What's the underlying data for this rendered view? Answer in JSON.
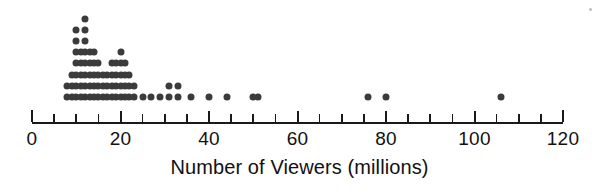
{
  "chart_data": {
    "type": "dotplot",
    "title": "",
    "xlabel": "Number of Viewers (millions)",
    "ylabel": "",
    "xlim": [
      0,
      120
    ],
    "grid": false,
    "legend": null,
    "tick_labels": [
      "0",
      "20",
      "40",
      "60",
      "80",
      "100",
      "120"
    ],
    "tick_values": [
      0,
      20,
      40,
      60,
      80,
      100,
      120
    ],
    "minor_tick_step": 5,
    "dot_color": "#3b3b3b",
    "axis_color": "#1a1a1a",
    "value_counts": [
      {
        "value": 8,
        "count": 2
      },
      {
        "value": 9,
        "count": 3
      },
      {
        "value": 10,
        "count": 7
      },
      {
        "value": 11,
        "count": 5
      },
      {
        "value": 12,
        "count": 8
      },
      {
        "value": 13,
        "count": 5
      },
      {
        "value": 14,
        "count": 5
      },
      {
        "value": 15,
        "count": 4
      },
      {
        "value": 16,
        "count": 3
      },
      {
        "value": 17,
        "count": 3
      },
      {
        "value": 18,
        "count": 4
      },
      {
        "value": 19,
        "count": 4
      },
      {
        "value": 20,
        "count": 5
      },
      {
        "value": 21,
        "count": 4
      },
      {
        "value": 22,
        "count": 3
      },
      {
        "value": 23,
        "count": 2
      },
      {
        "value": 25,
        "count": 1
      },
      {
        "value": 27,
        "count": 1
      },
      {
        "value": 29,
        "count": 1
      },
      {
        "value": 31,
        "count": 2
      },
      {
        "value": 33,
        "count": 2
      },
      {
        "value": 36,
        "count": 1
      },
      {
        "value": 40,
        "count": 1
      },
      {
        "value": 44,
        "count": 1
      },
      {
        "value": 50,
        "count": 1
      },
      {
        "value": 51,
        "count": 1
      },
      {
        "value": 76,
        "count": 1
      },
      {
        "value": 80,
        "count": 1
      },
      {
        "value": 106,
        "count": 1
      }
    ]
  },
  "axis": {
    "title": "Number of Viewers (millions)"
  },
  "labels": {
    "t0": "0",
    "t20": "20",
    "t40": "40",
    "t60": "60",
    "t80": "80",
    "t100": "100",
    "t120": "120"
  }
}
